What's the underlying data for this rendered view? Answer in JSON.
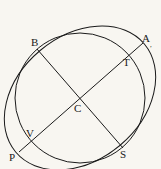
{
  "diagram": {
    "type": "geometry",
    "center": {
      "label": "C",
      "x": 80,
      "y": 98
    },
    "circle": {
      "cx": 80,
      "cy": 98,
      "r": 65
    },
    "ellipse": {
      "cx": 80,
      "cy": 98,
      "rx": 84,
      "ry": 62,
      "rotation": -40
    },
    "lines": [
      {
        "from": "B",
        "to": "S"
      },
      {
        "from": "P",
        "to": "A"
      }
    ],
    "points": [
      {
        "label": "A",
        "x": 143,
        "y": 43
      },
      {
        "label": "B",
        "x": 37,
        "y": 49
      },
      {
        "label": "C",
        "x": 80,
        "y": 98
      },
      {
        "label": "T",
        "x": 128,
        "y": 54
      },
      {
        "label": "V",
        "x": 31,
        "y": 141
      },
      {
        "label": "P",
        "x": 19,
        "y": 152
      },
      {
        "label": "S",
        "x": 123,
        "y": 148
      }
    ],
    "labels": {
      "A": "A",
      "A_mark": ",",
      "B": "B",
      "C": "C",
      "T": "T",
      "V": "V",
      "P": "P",
      "S": "S"
    },
    "colors": {
      "stroke": "#1a1a1a",
      "background": "#f8f6f1"
    }
  }
}
